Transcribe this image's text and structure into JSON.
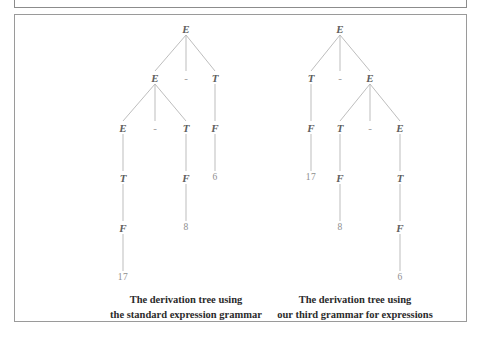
{
  "figure": {
    "background_color": "#ffffff",
    "frame_color": "#9a9a9a",
    "node_color": "#5e5e5e",
    "terminal_color": "#8e8e8e",
    "edge_color": "#b5b5b5",
    "caption_color": "#2b2b2b"
  },
  "trees": [
    {
      "id": "left-tree",
      "caption_line1": "The derivation tree using",
      "caption_line2": "the standard expression grammar",
      "caption_x": 186,
      "caption_y": 292,
      "nodes": [
        {
          "id": "L0",
          "label": "E",
          "kind": "nonterminal",
          "x": 186,
          "y": 29
        },
        {
          "id": "L1",
          "label": "E",
          "kind": "nonterminal",
          "x": 155,
          "y": 78
        },
        {
          "id": "L2",
          "label": "-",
          "kind": "operator",
          "x": 186,
          "y": 78
        },
        {
          "id": "L3",
          "label": "T",
          "kind": "nonterminal",
          "x": 215,
          "y": 78
        },
        {
          "id": "L4",
          "label": "E",
          "kind": "nonterminal",
          "x": 123,
          "y": 128
        },
        {
          "id": "L5",
          "label": "-",
          "kind": "operator",
          "x": 155,
          "y": 128
        },
        {
          "id": "L6",
          "label": "T",
          "kind": "nonterminal",
          "x": 186,
          "y": 128
        },
        {
          "id": "L7",
          "label": "F",
          "kind": "nonterminal",
          "x": 215,
          "y": 128
        },
        {
          "id": "L8",
          "label": "T",
          "kind": "nonterminal",
          "x": 123,
          "y": 178
        },
        {
          "id": "L9",
          "label": "F",
          "kind": "nonterminal",
          "x": 186,
          "y": 178
        },
        {
          "id": "L10",
          "label": "6",
          "kind": "terminal",
          "x": 215,
          "y": 178
        },
        {
          "id": "L11",
          "label": "F",
          "kind": "nonterminal",
          "x": 123,
          "y": 228
        },
        {
          "id": "L12",
          "label": "8",
          "kind": "terminal",
          "x": 186,
          "y": 228
        },
        {
          "id": "L13",
          "label": "17",
          "kind": "terminal",
          "x": 123,
          "y": 278
        }
      ],
      "edges": [
        [
          "L0",
          "L1"
        ],
        [
          "L0",
          "L2"
        ],
        [
          "L0",
          "L3"
        ],
        [
          "L1",
          "L4"
        ],
        [
          "L1",
          "L5"
        ],
        [
          "L1",
          "L6"
        ],
        [
          "L3",
          "L7"
        ],
        [
          "L4",
          "L8"
        ],
        [
          "L6",
          "L9"
        ],
        [
          "L7",
          "L10"
        ],
        [
          "L8",
          "L11"
        ],
        [
          "L9",
          "L12"
        ],
        [
          "L11",
          "L13"
        ]
      ]
    },
    {
      "id": "right-tree",
      "caption_line1": "The derivation tree using",
      "caption_line2": "our third grammar for expressions",
      "caption_x": 355,
      "caption_y": 292,
      "nodes": [
        {
          "id": "R0",
          "label": "E",
          "kind": "nonterminal",
          "x": 340,
          "y": 29
        },
        {
          "id": "R1",
          "label": "T",
          "kind": "nonterminal",
          "x": 311,
          "y": 78
        },
        {
          "id": "R2",
          "label": "-",
          "kind": "operator",
          "x": 340,
          "y": 78
        },
        {
          "id": "R3",
          "label": "E",
          "kind": "nonterminal",
          "x": 370,
          "y": 78
        },
        {
          "id": "R4",
          "label": "F",
          "kind": "nonterminal",
          "x": 311,
          "y": 128
        },
        {
          "id": "R5",
          "label": "T",
          "kind": "nonterminal",
          "x": 340,
          "y": 128
        },
        {
          "id": "R6",
          "label": "-",
          "kind": "operator",
          "x": 370,
          "y": 128
        },
        {
          "id": "R7",
          "label": "E",
          "kind": "nonterminal",
          "x": 400,
          "y": 128
        },
        {
          "id": "R8",
          "label": "17",
          "kind": "terminal",
          "x": 311,
          "y": 178
        },
        {
          "id": "R9",
          "label": "F",
          "kind": "nonterminal",
          "x": 340,
          "y": 178
        },
        {
          "id": "R10",
          "label": "T",
          "kind": "nonterminal",
          "x": 400,
          "y": 178
        },
        {
          "id": "R11",
          "label": "8",
          "kind": "terminal",
          "x": 340,
          "y": 228
        },
        {
          "id": "R12",
          "label": "F",
          "kind": "nonterminal",
          "x": 400,
          "y": 228
        },
        {
          "id": "R13",
          "label": "6",
          "kind": "terminal",
          "x": 400,
          "y": 278
        }
      ],
      "edges": [
        [
          "R0",
          "R1"
        ],
        [
          "R0",
          "R2"
        ],
        [
          "R0",
          "R3"
        ],
        [
          "R1",
          "R4"
        ],
        [
          "R3",
          "R5"
        ],
        [
          "R3",
          "R6"
        ],
        [
          "R3",
          "R7"
        ],
        [
          "R4",
          "R8"
        ],
        [
          "R5",
          "R9"
        ],
        [
          "R7",
          "R10"
        ],
        [
          "R9",
          "R11"
        ],
        [
          "R10",
          "R12"
        ],
        [
          "R12",
          "R13"
        ]
      ]
    }
  ]
}
